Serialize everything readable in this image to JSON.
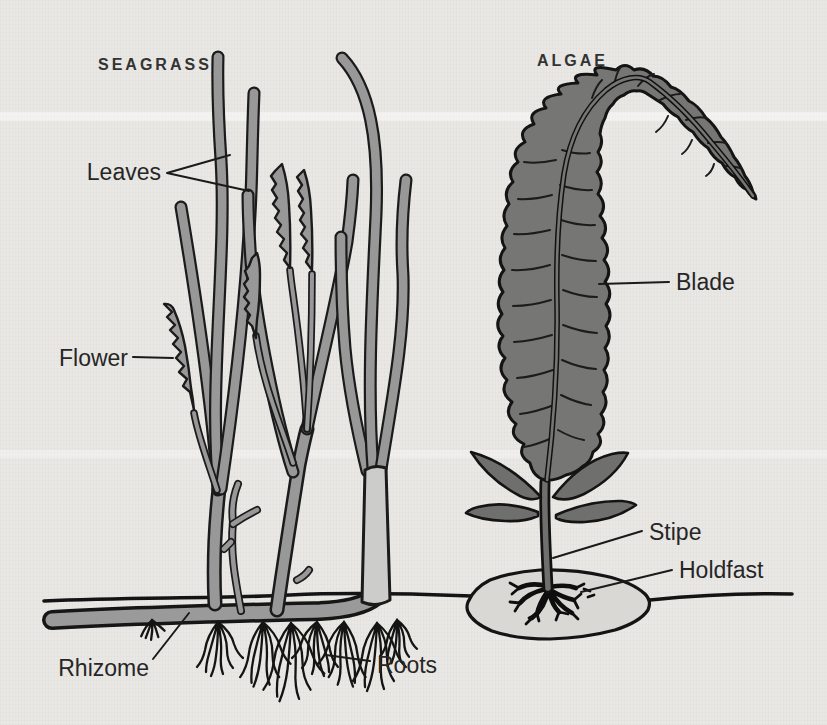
{
  "figure": {
    "background": "#e9e8e5",
    "seagrass": {
      "title": "SEAGRASS",
      "labels": {
        "leaves": "Leaves",
        "flower": "Flower",
        "rhizome": "Rhizome",
        "roots": "Roots"
      }
    },
    "algae": {
      "title": "ALGAE",
      "labels": {
        "blade": "Blade",
        "stipe": "Stipe",
        "holdfast": "Holdfast"
      }
    },
    "palette": {
      "outline": "#1b1b1b",
      "seagrass_fill": "#989898",
      "sheath_fill": "#ccccca",
      "rhizome_fill": "#9a9a9a",
      "algae_fill": "#767674",
      "rock_fill": "#d9d8d4",
      "label_color": "#262626"
    }
  }
}
